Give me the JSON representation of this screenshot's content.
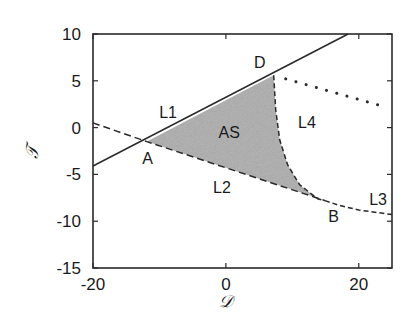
{
  "chart_data": {
    "type": "line",
    "title": "",
    "xlabel": "𝒟",
    "ylabel": "𝒯",
    "xlim": [
      -20,
      25
    ],
    "ylim": [
      -15,
      10
    ],
    "xticks": [
      -20,
      0,
      20
    ],
    "yticks": [
      10,
      5,
      0,
      -5,
      -10,
      -15
    ],
    "grid": false,
    "legend": null,
    "series": [
      {
        "name": "L1 boundary (solid)",
        "style": "solid",
        "points": [
          [
            -20,
            -4.1
          ],
          [
            18.4,
            10
          ]
        ]
      },
      {
        "name": "L2 boundary (dashed)",
        "style": "dashed",
        "points": [
          [
            -20,
            0.5
          ],
          [
            -11.9,
            -1.5
          ],
          [
            14.9,
            -7.8
          ]
        ]
      },
      {
        "name": "L3 boundary (dash-dot)",
        "style": "dashdot",
        "points": [
          [
            14.9,
            -7.8
          ],
          [
            17,
            -8.3
          ],
          [
            20,
            -8.8
          ],
          [
            25,
            -9.3
          ]
        ]
      },
      {
        "name": "AS/L4 boundary (dash-dot curve)",
        "style": "dashdot",
        "points": [
          [
            7.2,
            5.6
          ],
          [
            7.5,
            1.9
          ],
          [
            8.1,
            -1.3
          ],
          [
            9.3,
            -4.0
          ],
          [
            11.1,
            -6.1
          ],
          [
            13.8,
            -7.6
          ],
          [
            14.9,
            -7.8
          ]
        ]
      },
      {
        "name": "dotted line",
        "style": "dotted",
        "points": [
          [
            9.0,
            5.2
          ],
          [
            23.0,
            2.4
          ]
        ]
      }
    ],
    "shaded_region": {
      "name": "AS",
      "color": "#b5b5b5",
      "points": [
        [
          -11.9,
          -1.5
        ],
        [
          7.2,
          5.6
        ],
        [
          7.5,
          1.9
        ],
        [
          8.1,
          -1.3
        ],
        [
          9.3,
          -4.0
        ],
        [
          11.1,
          -6.1
        ],
        [
          13.8,
          -7.6
        ],
        [
          14.9,
          -7.8
        ]
      ]
    },
    "points": [
      {
        "label": "A",
        "x": -11.9,
        "y": -1.5
      },
      {
        "label": "B",
        "x": 14.9,
        "y": -7.8
      },
      {
        "label": "D",
        "x": 7.2,
        "y": 5.6
      }
    ],
    "annotations": [
      {
        "text": "L1",
        "x": -8.7,
        "y": 1.7
      },
      {
        "text": "AS",
        "x": 0.5,
        "y": -0.5
      },
      {
        "text": "L4",
        "x": 12.2,
        "y": 0.6
      },
      {
        "text": "L2",
        "x": -0.6,
        "y": -6.3
      },
      {
        "text": "L3",
        "x": 22.9,
        "y": -7.6
      },
      {
        "text": "D",
        "x": 5.1,
        "y": 7.0
      },
      {
        "text": "A",
        "x": -11.8,
        "y": -3.2
      },
      {
        "text": "B",
        "x": 16.2,
        "y": -9.4
      }
    ]
  },
  "axes": {
    "x_label": "𝒟",
    "y_label": "𝒯",
    "x_ticks": [
      "-20",
      "0",
      "20"
    ],
    "y_ticks": [
      "10",
      "5",
      "0",
      "-5",
      "-10",
      "-15"
    ]
  }
}
